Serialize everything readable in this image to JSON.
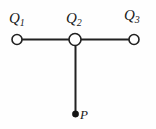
{
  "figure": {
    "background_color": "#fefefe",
    "stroke_color": "#212121",
    "node_fill_color": "#ffffff",
    "width": 156,
    "height": 129,
    "charges": [
      {
        "id": "q1",
        "symbol": "Q",
        "subscript": "1",
        "label": "Q1",
        "cx": 17,
        "cy": 39,
        "r": 5,
        "label_x": 9,
        "label_y": 11,
        "style": "open-circle"
      },
      {
        "id": "q2",
        "symbol": "Q",
        "subscript": "2",
        "label": "Q2",
        "cx": 75,
        "cy": 39,
        "r": 6,
        "label_x": 66,
        "label_y": 11,
        "style": "open-circle"
      },
      {
        "id": "q3",
        "symbol": "Q",
        "subscript": "3",
        "label": "Q3",
        "cx": 134,
        "cy": 39,
        "r": 5,
        "label_x": 124,
        "label_y": 8,
        "style": "open-circle"
      }
    ],
    "field_point": {
      "id": "p",
      "label": "P",
      "cx": 75,
      "cy": 114,
      "r": 3.2,
      "label_x": 80,
      "label_y": 108,
      "style": "filled-dot"
    },
    "segments": [
      {
        "id": "seg-q1-q2",
        "x1": 17,
        "y1": 39.5,
        "x2": 75,
        "y2": 39.5,
        "width": 2
      },
      {
        "id": "seg-q2-q3",
        "x1": 75,
        "y1": 39.5,
        "x2": 134,
        "y2": 39.5,
        "width": 2
      },
      {
        "id": "seg-q2-p",
        "x1": 75.5,
        "y1": 44,
        "x2": 75.5,
        "y2": 114,
        "width": 2
      }
    ]
  }
}
